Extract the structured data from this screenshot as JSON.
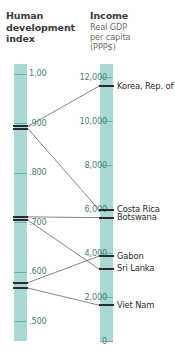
{
  "left_header": {
    "title_line1": "Human",
    "title_line2": "development",
    "title_line3": "index"
  },
  "right_header": {
    "title": "Income",
    "sub_line1": "Real GDP",
    "sub_line2": "per capita",
    "sub_line3": "(PPP$)"
  },
  "chart_data": {
    "type": "line",
    "subtype": "slope-graph / parallel-coordinates",
    "axes": [
      {
        "name": "hdi",
        "label": "Human development index",
        "position": "left",
        "ticks": [
          "1.00",
          ".900",
          ".800",
          ".700",
          ".600",
          ".500"
        ],
        "tick_values": [
          1.0,
          0.9,
          0.8,
          0.7,
          0.6,
          0.5
        ],
        "range": [
          0.46,
          1.02
        ],
        "direction": "descending-downward"
      },
      {
        "name": "income",
        "label": "Income Real GDP per capita (PPP$)",
        "position": "right",
        "ticks": [
          "12,000",
          "10,000",
          "8,000",
          "6,000",
          "4,000",
          "2,000",
          "0"
        ],
        "tick_values": [
          12000,
          10000,
          8000,
          6000,
          4000,
          2000,
          0
        ],
        "range": [
          0,
          12600
        ],
        "direction": "descending-downward"
      }
    ],
    "series": [
      {
        "name": "Korea, Rep. of",
        "hdi": 0.894,
        "income": 11594
      },
      {
        "name": "Costa Rica",
        "hdi": 0.889,
        "income": 5969
      },
      {
        "name": "Botswana",
        "hdi": 0.711,
        "income": 5611
      },
      {
        "name": "Gabon",
        "hdi": 0.578,
        "income": 3861
      },
      {
        "name": "Sri Lanka",
        "hdi": 0.704,
        "income": 3277
      },
      {
        "name": "Viet Nam",
        "hdi": 0.567,
        "income": 1630
      }
    ],
    "legend": null,
    "grid": false
  },
  "colors": {
    "bar_fill": "#a9d9d4",
    "tick": "#69b4ad",
    "tick_label": "#4d7f7a",
    "mark": "#2b2b2b",
    "link_line": "#6e6e6e",
    "title_text": "#3a3a3a",
    "sub_text": "#6d6d6d",
    "background": "#ffffff"
  }
}
